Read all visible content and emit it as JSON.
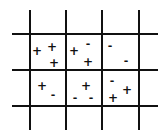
{
  "diagram": {
    "type": "grid-of-charges",
    "grid": {
      "vertical_lines_x": [
        30,
        66,
        102,
        139
      ],
      "vertical_span": [
        10,
        130
      ],
      "horizontal_lines_y": [
        34,
        70,
        106
      ],
      "horizontal_span": [
        12,
        158
      ]
    },
    "cells": [
      {
        "row": 0,
        "col": 0,
        "symbols": [
          {
            "char": "+",
            "x": 37,
            "y": 51
          },
          {
            "char": "+",
            "x": 52,
            "y": 47
          },
          {
            "char": "+",
            "x": 54,
            "y": 63
          }
        ]
      },
      {
        "row": 0,
        "col": 1,
        "symbols": [
          {
            "char": "+",
            "x": 74,
            "y": 51
          },
          {
            "char": "-",
            "x": 88,
            "y": 44
          },
          {
            "char": "+",
            "x": 88,
            "y": 62
          }
        ]
      },
      {
        "row": 0,
        "col": 2,
        "symbols": [
          {
            "char": "-",
            "x": 110,
            "y": 46
          },
          {
            "char": "-",
            "x": 126,
            "y": 61
          }
        ]
      },
      {
        "row": 1,
        "col": 0,
        "symbols": [
          {
            "char": "+",
            "x": 42,
            "y": 86
          },
          {
            "char": "-",
            "x": 53,
            "y": 95
          }
        ]
      },
      {
        "row": 1,
        "col": 1,
        "symbols": [
          {
            "char": "+",
            "x": 86,
            "y": 86
          },
          {
            "char": "-",
            "x": 75,
            "y": 98
          },
          {
            "char": "-",
            "x": 91,
            "y": 98
          }
        ]
      },
      {
        "row": 1,
        "col": 2,
        "symbols": [
          {
            "char": "-",
            "x": 112,
            "y": 81
          },
          {
            "char": "+",
            "x": 127,
            "y": 90
          },
          {
            "char": "+",
            "x": 113,
            "y": 98
          }
        ]
      }
    ]
  }
}
